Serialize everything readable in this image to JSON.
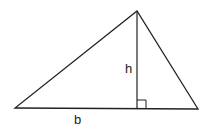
{
  "diagram": {
    "labels": {
      "height": "h",
      "base": "b"
    },
    "vertices": {
      "left": [
        15,
        108
      ],
      "right": [
        198,
        109
      ],
      "apex": [
        137,
        11
      ]
    },
    "altitude_foot": [
      137,
      108
    ],
    "right_angle_marker_size": 9,
    "stroke_color": "#222222",
    "background": "#ffffff"
  }
}
